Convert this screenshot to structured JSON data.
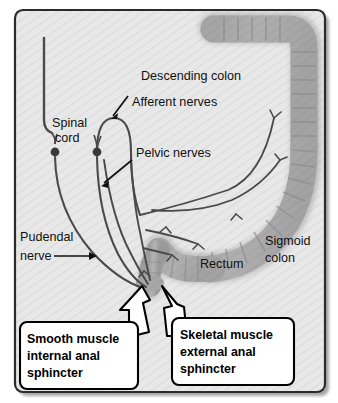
{
  "figure": {
    "type": "anatomical-diagram",
    "frame": {
      "border_color": "#2b2b2b",
      "background_color": "#e6e6e6",
      "hatch_color": "#dcdcdc",
      "shadow_color": "#9a9a9a"
    },
    "colors": {
      "organ_fill": "#a9a9a9",
      "organ_fill_light": "#bdbdbd",
      "organ_edge": "#8d8d8d",
      "nerve_line": "#4a4a4a",
      "ganglion": "#3a3a3a",
      "callout_fill": "#ffffff",
      "callout_border": "#000000",
      "arrow_fill": "#ffffff",
      "arrow_border": "#000000",
      "text": "#111111"
    }
  },
  "labels": {
    "descending_colon": "Descending colon",
    "afferent_nerves": "Afferent nerves",
    "spinal_cord_line1": "Spinal",
    "spinal_cord_line2": "cord",
    "pelvic_nerves": "Pelvic nerves",
    "pudendal_nerve_line1": "Pudendal",
    "pudendal_nerve_line2": "nerve",
    "sigmoid_colon_line1": "Sigmoid",
    "sigmoid_colon_line2": "colon",
    "rectum": "Rectum"
  },
  "callouts": [
    {
      "id": "internal-anal-sphincter",
      "lines": [
        "Smooth muscle",
        "internal anal",
        "sphincter"
      ]
    },
    {
      "id": "external-anal-sphincter",
      "lines": [
        "Skeletal muscle",
        "external anal",
        "sphincter"
      ]
    }
  ],
  "structures": [
    {
      "name": "descending-colon",
      "kind": "organ"
    },
    {
      "name": "sigmoid-colon",
      "kind": "organ"
    },
    {
      "name": "rectum",
      "kind": "organ"
    },
    {
      "name": "anal-canal",
      "kind": "organ"
    },
    {
      "name": "spinal-cord",
      "kind": "nerve-structure"
    },
    {
      "name": "afferent-nerve-loop",
      "kind": "nerve"
    },
    {
      "name": "pelvic-nerves",
      "kind": "nerve"
    },
    {
      "name": "pudendal-nerve",
      "kind": "nerve"
    },
    {
      "name": "dorsal-root-ganglion",
      "kind": "nerve-structure",
      "count": 2
    }
  ]
}
